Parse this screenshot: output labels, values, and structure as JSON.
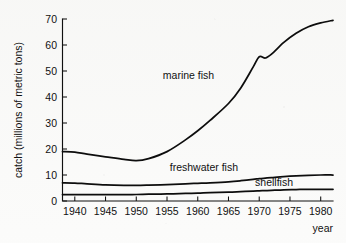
{
  "chart_data": {
    "type": "line",
    "title": "",
    "xlabel": "year",
    "ylabel": "catch (millions of metric tons)",
    "xlim": [
      1938,
      1982
    ],
    "ylim": [
      0,
      70
    ],
    "grid": false,
    "legend_position": "inline-labels",
    "xticks": [
      1940,
      1945,
      1950,
      1955,
      1960,
      1965,
      1970,
      1975,
      1980
    ],
    "yticks": [
      0,
      10,
      20,
      30,
      40,
      50,
      60,
      70
    ],
    "x": [
      1938,
      1940,
      1942,
      1945,
      1948,
      1950,
      1952,
      1955,
      1958,
      1960,
      1962,
      1965,
      1967,
      1969,
      1970,
      1971,
      1972,
      1974,
      1976,
      1978,
      1980,
      1982
    ],
    "series": [
      {
        "name": "marine fish",
        "label": "marine fish",
        "values": [
          19.0,
          18.8,
          18.0,
          17.0,
          16.0,
          15.5,
          16.3,
          19.0,
          23.5,
          27.0,
          31.0,
          37.5,
          43.5,
          51.5,
          55.5,
          55.0,
          56.5,
          61.0,
          64.5,
          67.0,
          68.5,
          69.5
        ],
        "label_x": 1958.5,
        "label_y": 48.5
      },
      {
        "name": "freshwater fish",
        "label": "freshwater fish",
        "values": [
          7.0,
          6.9,
          6.6,
          6.2,
          6.0,
          6.0,
          6.1,
          6.3,
          6.6,
          6.8,
          7.0,
          7.4,
          7.8,
          8.3,
          8.6,
          8.8,
          9.0,
          9.4,
          9.7,
          9.9,
          10.0,
          10.0
        ],
        "label_x": 1961.0,
        "label_y": 12.8
      },
      {
        "name": "shellfish",
        "label": "shellfish",
        "values": [
          2.5,
          2.5,
          2.5,
          2.5,
          2.5,
          2.5,
          2.6,
          2.7,
          2.9,
          3.0,
          3.2,
          3.4,
          3.6,
          3.8,
          3.9,
          4.0,
          4.1,
          4.3,
          4.4,
          4.5,
          4.5,
          4.5
        ],
        "label_x": 1975.5,
        "label_y": 7.2
      }
    ],
    "colors": {
      "axis": "#101010",
      "line": "#0d0d0d",
      "background": "#fbfbfa",
      "text": "#111111"
    }
  }
}
